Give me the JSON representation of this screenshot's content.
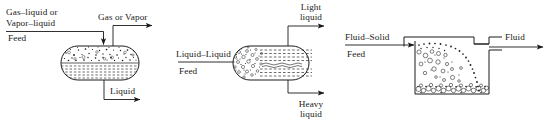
{
  "figure": {
    "stroke_color": "#1a1a1a"
  },
  "units": [
    {
      "id": "gas-liquid-separator",
      "type": "horizontal-capsule-vessel",
      "feed_label_line1": "Gas–liquid or",
      "feed_label_line2": "Vapor–liquid",
      "feed_label_line3": "Feed",
      "top_outlet_label": "Gas or Vapor",
      "bottom_outlet_label": "Liquid"
    },
    {
      "id": "liquid-liquid-separator",
      "type": "horizontal-capsule-vessel",
      "feed_label_line1": "Liquid–Liquid",
      "feed_label_line2": "Feed",
      "top_outlet_label_line1": "Light",
      "top_outlet_label_line2": "liquid",
      "bottom_outlet_label_line1": "Heavy",
      "bottom_outlet_label_line2": "liquid"
    },
    {
      "id": "fluid-solid-separator",
      "type": "rectangular-settling-tank",
      "feed_label_line1": "Fluid–Solid",
      "feed_label_line2": "Feed",
      "outlet_label": "Fluid"
    }
  ]
}
